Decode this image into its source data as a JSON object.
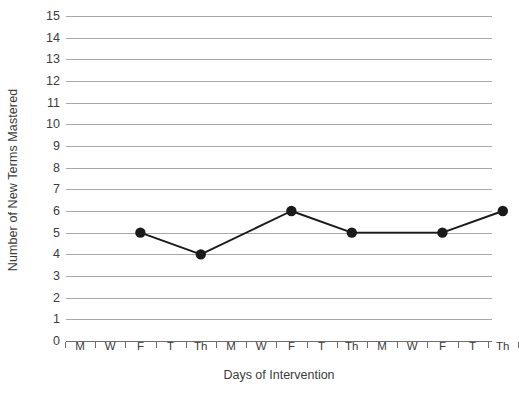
{
  "chart_data": {
    "type": "line",
    "title": "",
    "xlabel": "Days of Intervention",
    "ylabel": "Number of New Terms Mastered",
    "categories": [
      "M",
      "W",
      "F",
      "T",
      "Th",
      "M",
      "W",
      "F",
      "T",
      "Th",
      "M",
      "W",
      "F",
      "T",
      "Th"
    ],
    "y_ticks": [
      0,
      1,
      2,
      3,
      4,
      5,
      6,
      7,
      8,
      9,
      10,
      11,
      12,
      13,
      14,
      15
    ],
    "ylim": [
      0,
      15
    ],
    "grid": true,
    "legend": "none",
    "series": [
      {
        "name": "New terms mastered",
        "marker": "filled-circle",
        "color": "#1a1a1a",
        "points": [
          {
            "x_index": 2,
            "x_label": "F",
            "value": 5
          },
          {
            "x_index": 4,
            "x_label": "Th",
            "value": 4
          },
          {
            "x_index": 7,
            "x_label": "F",
            "value": 6
          },
          {
            "x_index": 9,
            "x_label": "Th",
            "value": 5
          },
          {
            "x_index": 12,
            "x_label": "F",
            "value": 5
          },
          {
            "x_index": 14,
            "x_label": "Th",
            "value": 6
          }
        ]
      }
    ],
    "colors": {
      "line": "#1a1a1a",
      "marker": "#1a1a1a",
      "gridline": "#a8a8a8",
      "axis": "#6e6e6e",
      "text": "#3c3c3c",
      "background": "#ffffff"
    }
  }
}
